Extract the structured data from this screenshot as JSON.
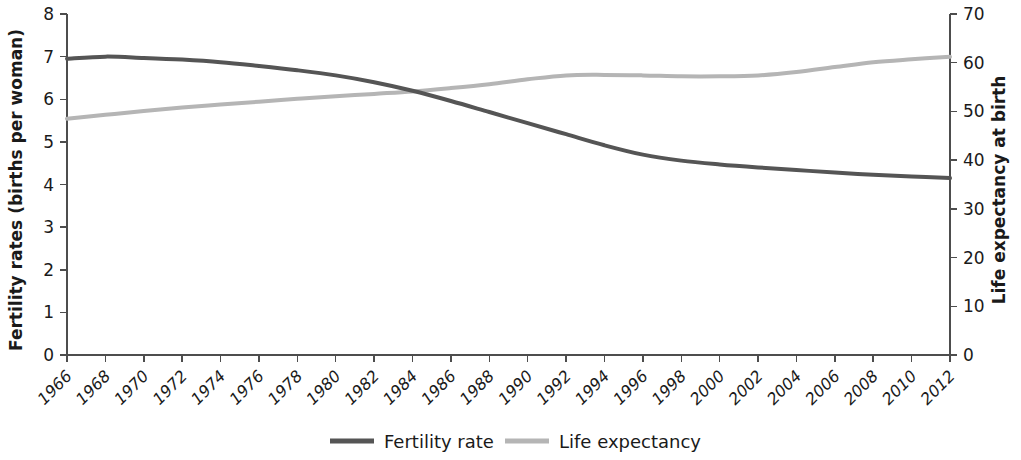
{
  "chart_data": {
    "type": "line",
    "title": "",
    "subtitle": "",
    "xlabel": "",
    "grid": false,
    "legend_position": "bottom",
    "x": [
      1966,
      1968,
      1970,
      1972,
      1974,
      1976,
      1978,
      1980,
      1982,
      1984,
      1986,
      1988,
      1990,
      1992,
      1994,
      1996,
      1998,
      2000,
      2002,
      2004,
      2006,
      2008,
      2010,
      2012
    ],
    "categories": [
      "1966",
      "1968",
      "1970",
      "1972",
      "1974",
      "1976",
      "1978",
      "1980",
      "1982",
      "1984",
      "1986",
      "1988",
      "1990",
      "1992",
      "1994",
      "1996",
      "1998",
      "2000",
      "2002",
      "2004",
      "2006",
      "2008",
      "2010",
      "2012"
    ],
    "axes": [
      {
        "id": "left",
        "label": "Fertility rates (births per woman)",
        "ylim": [
          0,
          8
        ],
        "ticks": [
          0,
          1,
          2,
          3,
          4,
          5,
          6,
          7,
          8
        ],
        "tick_labels": [
          "0",
          "1",
          "2",
          "3",
          "4",
          "5",
          "6",
          "7",
          "8"
        ]
      },
      {
        "id": "right",
        "label": "Life expectancy at birth",
        "ylim": [
          0,
          70
        ],
        "ticks": [
          0,
          10,
          20,
          30,
          40,
          50,
          60,
          70
        ],
        "tick_labels": [
          "0",
          "10",
          "20",
          "30",
          "40",
          "50",
          "60",
          "70"
        ]
      }
    ],
    "series": [
      {
        "name": "Fertility rate",
        "axis": "left",
        "color": "#555555",
        "width": 4.0,
        "values": [
          6.95,
          7.0,
          6.97,
          6.93,
          6.87,
          6.78,
          6.68,
          6.56,
          6.4,
          6.2,
          5.96,
          5.7,
          5.44,
          5.18,
          4.92,
          4.7,
          4.56,
          4.47,
          4.4,
          4.34,
          4.28,
          4.23,
          4.19,
          4.15
        ]
      },
      {
        "name": "Life expectancy",
        "axis": "right",
        "color": "#b5b5b5",
        "width": 4.0,
        "values": [
          48.5,
          49.3,
          50.1,
          50.8,
          51.4,
          52.0,
          52.6,
          53.1,
          53.6,
          54.1,
          54.8,
          55.6,
          56.6,
          57.4,
          57.5,
          57.4,
          57.2,
          57.2,
          57.4,
          58.1,
          59.1,
          60.1,
          60.7,
          61.2
        ]
      }
    ]
  },
  "legend": {
    "items": [
      {
        "label": "Fertility rate",
        "color": "#555555"
      },
      {
        "label": "Life expectancy",
        "color": "#b5b5b5"
      }
    ]
  }
}
